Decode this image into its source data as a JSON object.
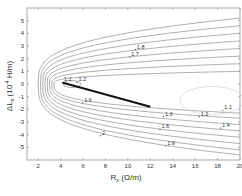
{
  "chart_data": {
    "type": "contour",
    "title": "",
    "xlabel": "R_x (Ω/m)",
    "ylabel": "ΔL_x (10^-4 H/m)",
    "xlim": [
      1,
      20
    ],
    "ylim": [
      -6,
      6
    ],
    "x_ticks": [
      2,
      4,
      6,
      8,
      10,
      12,
      14,
      16,
      18,
      20
    ],
    "y_ticks": [
      -5,
      -4,
      -3,
      -2,
      -1,
      0,
      1,
      2,
      3,
      4,
      5
    ],
    "grid": false,
    "legend": null,
    "contour_levels": [
      1.1,
      1.2,
      1.3,
      1.4,
      1.5,
      1.6,
      1.7,
      1.8,
      1.9,
      2.0
    ],
    "contour_labels": [
      {
        "text": "1.1",
        "x": 4.3,
        "y": 0.2
      },
      {
        "text": "1.2",
        "x": 5.6,
        "y": 0.2
      },
      {
        "text": "1.7",
        "x": 10.3,
        "y": 2.2
      },
      {
        "text": "1.8",
        "x": 10.8,
        "y": 2.8
      },
      {
        "text": "1.6",
        "x": 6.1,
        "y": -1.4
      },
      {
        "text": "2",
        "x": 7.7,
        "y": -4.0
      },
      {
        "text": "1.3",
        "x": 13.3,
        "y": -2.5
      },
      {
        "text": "1.2",
        "x": 16.5,
        "y": -2.5
      },
      {
        "text": "1.1",
        "x": 18.6,
        "y": -2.0
      },
      {
        "text": "1.6",
        "x": 13.0,
        "y": -3.5
      },
      {
        "text": "1.4",
        "x": 18.4,
        "y": -3.4
      },
      {
        "text": "1.9",
        "x": 13.5,
        "y": -4.8
      }
    ],
    "trajectory": {
      "description": "thick black line",
      "start": {
        "x": 4.2,
        "y": 0.1
      },
      "end": {
        "x": 12.0,
        "y": -1.8
      }
    }
  },
  "axes": {
    "x_label_main": "R",
    "x_label_sub": "x",
    "x_label_unit": " (Ω/m)",
    "y_label_main": "ΔL",
    "y_label_sub": "x",
    "y_label_unit": " (10",
    "y_label_exp": "-4",
    "y_label_unit2": " H/m)"
  }
}
